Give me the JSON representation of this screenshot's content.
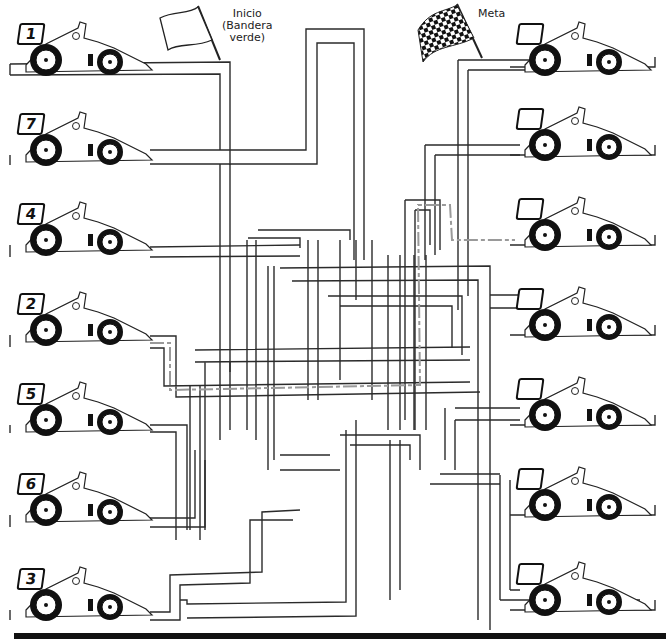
{
  "worksheet": {
    "start_label": {
      "line1": "Inicio",
      "line2": "(Bandera",
      "line3": "verde)"
    },
    "finish_label": "Meta",
    "start_flag": "white-flag",
    "finish_flag": "checkered-flag"
  },
  "left_cars": [
    {
      "number": "1",
      "y": 20
    },
    {
      "number": "7",
      "y": 110
    },
    {
      "number": "4",
      "y": 200
    },
    {
      "number": "2",
      "y": 290
    },
    {
      "number": "5",
      "y": 380
    },
    {
      "number": "6",
      "y": 470
    },
    {
      "number": "3",
      "y": 565
    }
  ],
  "right_cars": [
    {
      "number": "",
      "y": 20
    },
    {
      "number": "",
      "y": 105
    },
    {
      "number": "",
      "y": 195
    },
    {
      "number": "",
      "y": 285
    },
    {
      "number": "",
      "y": 375
    },
    {
      "number": "",
      "y": 465
    },
    {
      "number": "",
      "y": 560
    }
  ],
  "colors": {
    "line": "#2b2b2b",
    "solution_path": "#9a9a9a",
    "background": "#ffffff",
    "bottom_bar": "#111111"
  }
}
